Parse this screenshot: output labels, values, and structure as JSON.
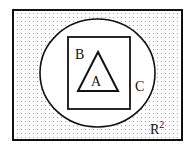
{
  "diagram": {
    "type": "venn-set-inclusion",
    "universe": {
      "label": "R",
      "superscript": "2",
      "shape": "rectangle",
      "fill": "dotted"
    },
    "sets": [
      {
        "id": "C",
        "label": "C",
        "shape": "circle",
        "contains": [
          "B"
        ]
      },
      {
        "id": "B",
        "label": "B",
        "shape": "rectangle",
        "contains": [
          "A"
        ]
      },
      {
        "id": "A",
        "label": "A",
        "shape": "triangle",
        "contains": []
      }
    ],
    "relation": "A ⊂ B ⊂ C ⊂ R²"
  },
  "colors": {
    "stroke": "#111111",
    "dot": "#9a9a9a",
    "background": "#ffffff"
  }
}
